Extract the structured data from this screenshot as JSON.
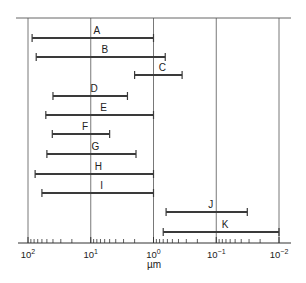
{
  "chart_data": {
    "type": "range-bar",
    "title": "",
    "xlabel": "µm",
    "ylabel": "",
    "x_scale": "log",
    "x_reversed": true,
    "xlim": [
      100,
      0.01
    ],
    "grid": "vertical lines at each decade",
    "legend": "none",
    "tick_labels": [
      {
        "value": 100,
        "base": "10",
        "exp": "2"
      },
      {
        "value": 10,
        "base": "10",
        "exp": "1"
      },
      {
        "value": 1,
        "base": "10",
        "exp": "0"
      },
      {
        "value": 0.1,
        "base": "10",
        "exp": "−1"
      },
      {
        "value": 0.01,
        "base": "10",
        "exp": "−2"
      }
    ],
    "categories": [
      "A",
      "B",
      "C",
      "D",
      "E",
      "F",
      "G",
      "H",
      "I",
      "J",
      "K"
    ],
    "series": [
      {
        "name": "A",
        "from": 86,
        "to": 1.0
      },
      {
        "name": "B",
        "from": 74,
        "to": 0.65
      },
      {
        "name": "C",
        "from": 2.0,
        "to": 0.35
      },
      {
        "name": "D",
        "from": 40,
        "to": 2.6
      },
      {
        "name": "E",
        "from": 52,
        "to": 1.0
      },
      {
        "name": "F",
        "from": 41,
        "to": 5.0
      },
      {
        "name": "G",
        "from": 50,
        "to": 1.9
      },
      {
        "name": "H",
        "from": 77,
        "to": 1.0
      },
      {
        "name": "I",
        "from": 60,
        "to": 1.0
      },
      {
        "name": "J",
        "from": 0.63,
        "to": 0.032
      },
      {
        "name": "K",
        "from": 0.7,
        "to": 0.01
      }
    ]
  },
  "colors": {
    "bar": "#3a3a3a",
    "grid": "#555555",
    "axis": "#333333",
    "text": "#222222"
  }
}
